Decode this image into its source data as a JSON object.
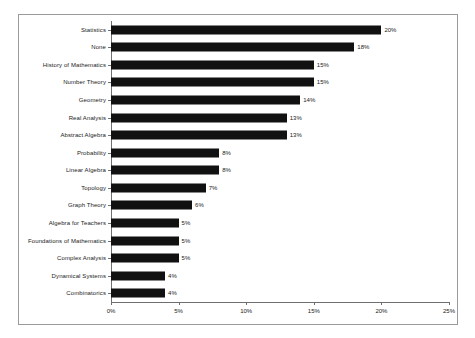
{
  "chart_data": {
    "type": "bar",
    "orientation": "horizontal",
    "title": "",
    "xlabel": "",
    "ylabel": "",
    "xlim": [
      0,
      25
    ],
    "grid": false,
    "legend": null,
    "xticks": [
      "0%",
      "5%",
      "10%",
      "15%",
      "20%",
      "25%"
    ],
    "xtick_values": [
      0,
      5,
      10,
      15,
      20,
      25
    ],
    "categories": [
      "Statistics",
      "None",
      "History of Mathematics",
      "Number Theory",
      "Geometry",
      "Real Analysis",
      "Abstract Algebra",
      "Probability",
      "Linear Algebra",
      "Topology",
      "Graph Theory",
      "Algebra for Teachers",
      "Foundations of Mathematics",
      "Complex Analysis",
      "Dynamical Systems",
      "Combinatorics"
    ],
    "values": [
      20,
      18,
      15,
      15,
      14,
      13,
      13,
      8,
      8,
      7,
      6,
      5,
      5,
      5,
      4,
      4
    ],
    "data_labels": [
      "20%",
      "18%",
      "15%",
      "15%",
      "14%",
      "13%",
      "13%",
      "8%",
      "8%",
      "7%",
      "6%",
      "5%",
      "5%",
      "5%",
      "4%",
      "4%"
    ],
    "bar_color": "#111111",
    "axis_color": "#6f6f6f",
    "text_color": "#1a1a1a",
    "border_color": "#9a9a9a",
    "background_color": "#ffffff"
  }
}
